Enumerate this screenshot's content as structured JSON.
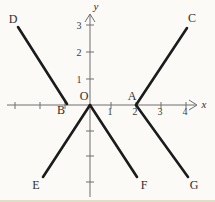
{
  "figure": {
    "background": "#fbfaf7",
    "segment_color": "#1b1b1b",
    "axis_color": "#6e6e6e",
    "label_color": "#2e2e2e",
    "axes": {
      "x_label": "x",
      "y_label": "y",
      "x_axis_px": {
        "y": 105,
        "x1": 7,
        "x2": 196
      },
      "y_axis_px": {
        "x": 90,
        "y1": 14,
        "y2": 197
      }
    },
    "x_ticks": [
      {
        "label": "",
        "px": 15
      },
      {
        "label": "",
        "px": 40
      },
      {
        "label": "",
        "px": 65
      },
      {
        "label": "1",
        "px": 111
      },
      {
        "label": "2",
        "px": 136
      },
      {
        "label": "3",
        "px": 161
      },
      {
        "label": "4",
        "px": 186
      }
    ],
    "y_ticks": [
      {
        "label": "3",
        "px": 25
      },
      {
        "label": "2",
        "px": 52
      },
      {
        "label": "1",
        "px": 79
      },
      {
        "label": "",
        "px": 131
      },
      {
        "label": "",
        "px": 156
      },
      {
        "label": "",
        "px": 182
      }
    ],
    "points": [
      {
        "name": "D",
        "coords": [
          -3,
          3
        ],
        "px": [
          18,
          27
        ],
        "label_px": [
          13,
          19
        ]
      },
      {
        "name": "C",
        "coords": [
          4,
          3
        ],
        "px": [
          187,
          28
        ],
        "label_px": [
          192,
          18
        ]
      },
      {
        "name": "B",
        "coords": [
          -1,
          0
        ],
        "px": [
          67,
          104
        ],
        "label_px": [
          61,
          110
        ]
      },
      {
        "name": "O",
        "coords": [
          0,
          0
        ],
        "px": [
          90,
          105
        ],
        "label_px": [
          84,
          96
        ]
      },
      {
        "name": "A",
        "coords": [
          2,
          0
        ],
        "px": [
          136,
          105
        ],
        "label_px": [
          132,
          96
        ]
      },
      {
        "name": "E",
        "coords": [
          -2,
          -3
        ],
        "px": [
          43,
          177
        ],
        "label_px": [
          36,
          185
        ]
      },
      {
        "name": "F",
        "coords": [
          2,
          -3
        ],
        "px": [
          137,
          177
        ],
        "label_px": [
          144,
          185
        ]
      },
      {
        "name": "G",
        "coords": [
          4,
          -3
        ],
        "px": [
          188,
          177
        ],
        "label_px": [
          194,
          185
        ]
      }
    ],
    "segments": [
      {
        "from": "D",
        "to": "B"
      },
      {
        "from": "E",
        "to": "O"
      },
      {
        "from": "O",
        "to": "F"
      },
      {
        "from": "A",
        "to": "C"
      },
      {
        "from": "A",
        "to": "G"
      }
    ]
  },
  "chart_data": {
    "type": "line",
    "title": "",
    "xlabel": "x",
    "ylabel": "y",
    "xlim": [
      -3.5,
      4.5
    ],
    "ylim": [
      -3.5,
      3.5
    ],
    "x_tick_labels": [
      "1",
      "2",
      "3",
      "4"
    ],
    "y_tick_labels": [
      "1",
      "2",
      "3"
    ],
    "grid": false,
    "series": [
      {
        "name": "DB",
        "x": [
          -3,
          -1
        ],
        "y": [
          3,
          0
        ]
      },
      {
        "name": "EO",
        "x": [
          -2,
          0
        ],
        "y": [
          -3,
          0
        ]
      },
      {
        "name": "OF",
        "x": [
          0,
          2
        ],
        "y": [
          0,
          -3
        ]
      },
      {
        "name": "AC",
        "x": [
          2,
          4
        ],
        "y": [
          0,
          3
        ]
      },
      {
        "name": "AG",
        "x": [
          2,
          4
        ],
        "y": [
          0,
          -3
        ]
      }
    ]
  }
}
